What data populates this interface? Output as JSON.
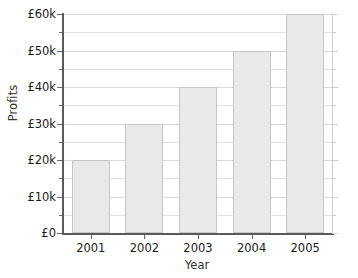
{
  "chart_data": {
    "type": "bar",
    "title": "",
    "xlabel": "Year",
    "ylabel": "Profits",
    "categories": [
      "2001",
      "2002",
      "2003",
      "2004",
      "2005"
    ],
    "values": [
      20000,
      30000,
      40000,
      50000,
      60000
    ],
    "value_labels": [
      "£20k",
      "£30k",
      "£40k",
      "£50k",
      "£60k"
    ],
    "ylim": [
      0,
      60000
    ],
    "ytick_values": [
      0,
      10000,
      20000,
      30000,
      40000,
      50000,
      60000
    ],
    "ytick_labels": [
      "£0",
      "£10k",
      "£20k",
      "£30k",
      "£40k",
      "£50k",
      "£60k"
    ],
    "minor_gridline_values": [
      5000,
      15000,
      25000,
      35000,
      45000,
      55000
    ],
    "grid": true,
    "grid_axis": "y",
    "legend": false,
    "legend_position": "none",
    "currency": "GBP",
    "bar_color": "#e9e9e9",
    "bar_border_color": "#c6c6c6",
    "axis_color": "#5a5a5a",
    "grid_color": "#e2e2e2",
    "text_color": "#1a1a1a",
    "background_color": "#ffffff"
  }
}
